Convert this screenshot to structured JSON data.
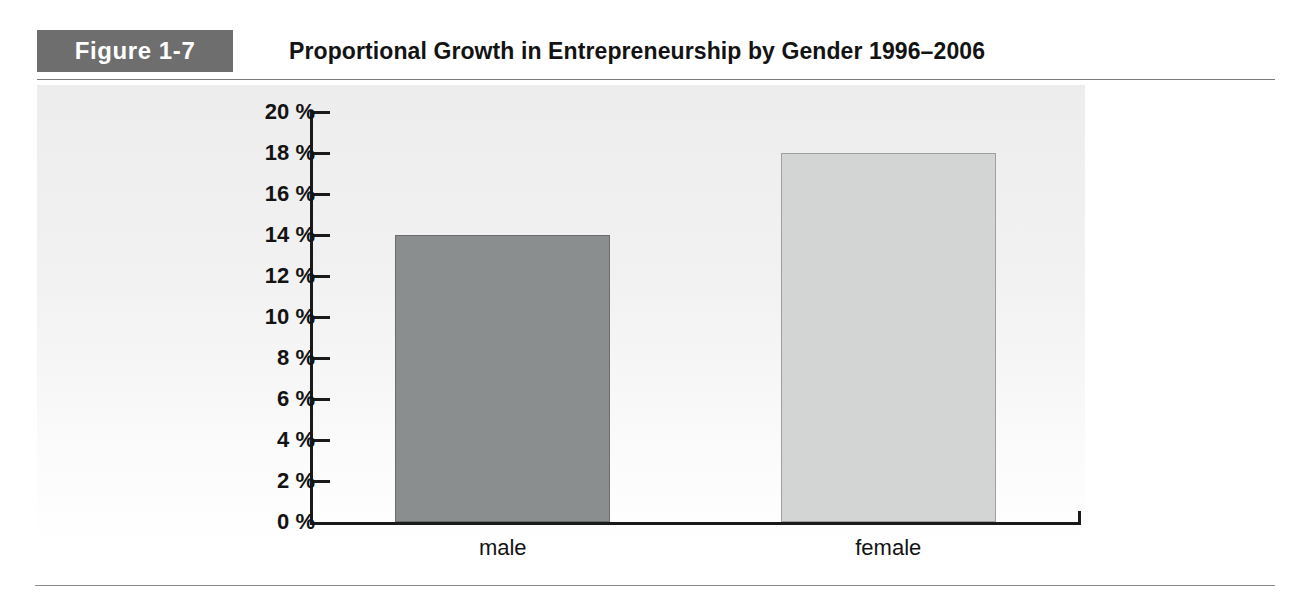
{
  "figure": {
    "badge_label": "Figure 1-7",
    "title": "Proportional Growth in Entrepreneurship by Gender 1996–2006"
  },
  "chart_data": {
    "type": "bar",
    "title": "Proportional Growth in Entrepreneurship by Gender 1996–2006",
    "xlabel": "",
    "ylabel": "",
    "categories": [
      "male",
      "female"
    ],
    "values": [
      14,
      18
    ],
    "value_unit": "%",
    "ylim": [
      0,
      20
    ],
    "ytick_step": 2,
    "ytick_labels": [
      "20 %",
      "18 %",
      "16 %",
      "14 %",
      "12 %",
      "10 %",
      "8 %",
      "6 %",
      "4 %",
      "2 %",
      "0 %"
    ],
    "ytick_values": [
      20,
      18,
      16,
      14,
      12,
      10,
      8,
      6,
      4,
      2,
      0
    ],
    "grid": false,
    "legend": false,
    "series": [
      {
        "name": "Proportional growth",
        "points": [
          {
            "category": "male",
            "value": 14,
            "label": "14 %",
            "color": "#8b8e8e"
          },
          {
            "category": "female",
            "value": 18,
            "label": "18 %",
            "color": "#d3d4d4"
          }
        ]
      }
    ],
    "colors": {
      "male_bar": "#8b8e8e",
      "female_bar": "#d3d4d4",
      "bar_outline": "#6f7272",
      "axis": "#1a1a1a",
      "badge_background": "#6e6e6e",
      "badge_text": "#ffffff",
      "plot_background": "#efefef",
      "text": "#131313"
    }
  }
}
